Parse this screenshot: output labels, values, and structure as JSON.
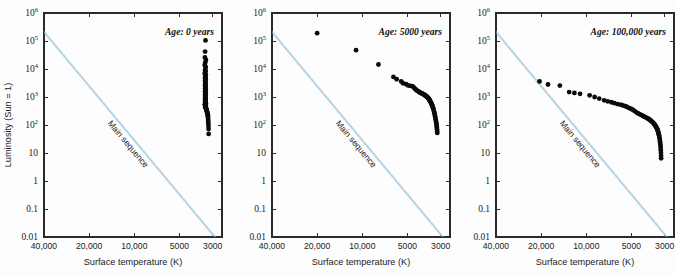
{
  "figure": {
    "panel_count": 3
  },
  "axes": {
    "xlabel": "Surface temperature (K)",
    "ylabel": "Luminosity (Sun = 1)",
    "x_ticks": [
      "40,000",
      "20,000",
      "10,000",
      "5000",
      "3000"
    ],
    "x_tick_values": [
      40000,
      20000,
      10000,
      5000,
      3000
    ],
    "xlim": [
      40000,
      2600
    ],
    "x_scale": "log-reversed",
    "y_ticks": [
      "10^6",
      "10^5",
      "10^4",
      "10^3",
      "10^2",
      "10",
      "1",
      "0.1",
      "0.01"
    ],
    "y_tick_mantissa": [
      "10",
      "10",
      "10",
      "10",
      "10",
      "10",
      "1",
      "0.1",
      "0.01"
    ],
    "y_tick_exponent": [
      "6",
      "5",
      "4",
      "3",
      "2",
      "",
      "",
      "",
      ""
    ],
    "y_tick_values": [
      1000000,
      100000,
      10000,
      1000,
      100,
      10,
      1,
      0.1,
      0.01
    ],
    "ylim": [
      0.01,
      1000000
    ],
    "y_scale": "log",
    "grid": false
  },
  "colors": {
    "main_sequence_line": "#b6d4e4",
    "data_point": "#0a0a0a",
    "axis": "#2b2b2b",
    "background": "#ffffff"
  },
  "main_sequence": {
    "label": "Main sequence",
    "start": {
      "temperature": 40000,
      "luminosity": 210000
    },
    "end": {
      "temperature": 2900,
      "luminosity": 0.01
    }
  },
  "chart_data": [
    {
      "type": "scatter",
      "title": "Age: 0 years",
      "xlabel": "Surface temperature (K)",
      "ylabel": "Luminosity (Sun = 1)",
      "xlim": [
        40000,
        2600
      ],
      "ylim": [
        0.01,
        1000000
      ],
      "grid": false,
      "series": [
        {
          "name": "Main sequence",
          "type": "line",
          "color": "#b6d4e4",
          "x": [
            40000,
            2900
          ],
          "y": [
            210000,
            0.01
          ]
        },
        {
          "name": "Protostars",
          "type": "scatter",
          "color": "#0a0a0a",
          "x": [
            3350,
            3370,
            3380,
            3330,
            3360,
            3390,
            3340,
            3355,
            3365,
            3345,
            3375,
            3385,
            3335,
            3350,
            3360,
            3370,
            3342,
            3358,
            3368,
            3348,
            3362,
            3352,
            3372,
            3346,
            3356,
            3366,
            3344,
            3354,
            3364,
            3374,
            3341,
            3351,
            3361,
            3371,
            3343,
            3353,
            3363,
            3373,
            3347,
            3357,
            3367,
            3349,
            3359,
            3369,
            3339,
            3331,
            3376,
            3386,
            3333,
            3343,
            3353,
            3363,
            3321,
            3311,
            3301,
            3291,
            3281,
            3271,
            3261,
            3251,
            3241,
            3231,
            3226,
            3221,
            3216,
            3211,
            3206,
            3201,
            3196,
            3191
          ],
          "y": [
            105000,
            42000,
            26000,
            21000,
            17000,
            14000,
            12000,
            10500,
            9000,
            8200,
            7400,
            6800,
            6200,
            5600,
            5100,
            4700,
            4300,
            3950,
            3600,
            3300,
            3050,
            2800,
            2600,
            2400,
            2200,
            2050,
            1900,
            1780,
            1650,
            1540,
            1440,
            1350,
            1270,
            1190,
            1120,
            1050,
            990,
            930,
            880,
            830,
            780,
            740,
            700,
            660,
            620,
            590,
            555,
            525,
            495,
            470,
            445,
            420,
            395,
            372,
            350,
            330,
            310,
            292,
            275,
            258,
            240,
            222,
            200,
            178,
            155,
            132,
            110,
            92,
            72,
            48
          ]
        }
      ]
    },
    {
      "type": "scatter",
      "title": "Age: 5000 years",
      "xlabel": "Surface temperature (K)",
      "ylabel": "Luminosity (Sun = 1)",
      "xlim": [
        40000,
        2600
      ],
      "ylim": [
        0.01,
        1000000
      ],
      "grid": false,
      "series": [
        {
          "name": "Main sequence",
          "type": "line",
          "color": "#b6d4e4",
          "x": [
            40000,
            2900
          ],
          "y": [
            210000,
            0.01
          ]
        },
        {
          "name": "Pre-main-sequence stars",
          "type": "scatter",
          "color": "#0a0a0a",
          "x": [
            20000,
            11000,
            7800,
            6200,
            5900,
            5500,
            5350,
            5100,
            4950,
            4800,
            4700,
            4600,
            4500,
            4420,
            4350,
            4280,
            4200,
            4150,
            4100,
            4050,
            4000,
            3960,
            3920,
            3880,
            3840,
            3800,
            3770,
            3740,
            3710,
            3680,
            3650,
            3620,
            3600,
            3580,
            3560,
            3540,
            3520,
            3500,
            3480,
            3460,
            3440,
            3420,
            3400,
            3380,
            3360,
            3340,
            3320,
            3300,
            3285,
            3270,
            3255,
            3240,
            3225,
            3210,
            3200,
            3190,
            3180,
            3175,
            3168,
            3162
          ],
          "y": [
            190000,
            47000,
            14500,
            5200,
            4300,
            3600,
            3100,
            2850,
            2600,
            2500,
            2450,
            2400,
            2100,
            1900,
            1750,
            1650,
            1550,
            1480,
            1420,
            1380,
            1340,
            1300,
            1260,
            1220,
            1180,
            1140,
            1100,
            1060,
            1020,
            980,
            940,
            900,
            860,
            820,
            780,
            740,
            700,
            660,
            620,
            580,
            540,
            500,
            460,
            420,
            380,
            340,
            300,
            265,
            235,
            205,
            180,
            158,
            138,
            120,
            105,
            92,
            80,
            70,
            60,
            52
          ]
        }
      ]
    },
    {
      "type": "scatter",
      "title": "Age: 100,000 years",
      "xlabel": "Surface temperature (K)",
      "ylabel": "Luminosity (Sun = 1)",
      "xlim": [
        40000,
        2600
      ],
      "ylim": [
        0.01,
        1000000
      ],
      "grid": false,
      "series": [
        {
          "name": "Main sequence",
          "type": "line",
          "color": "#b6d4e4",
          "x": [
            40000,
            2900
          ],
          "y": [
            210000,
            0.01
          ]
        },
        {
          "name": "Pre-main-sequence stars",
          "type": "scatter",
          "color": "#0a0a0a",
          "x": [
            20500,
            18000,
            15000,
            13000,
            12000,
            11000,
            9500,
            8800,
            8200,
            7600,
            7200,
            6800,
            6500,
            6200,
            5900,
            5700,
            5500,
            5350,
            5200,
            5050,
            4900,
            4780,
            4660,
            4550,
            4450,
            4350,
            4260,
            4180,
            4100,
            4030,
            3960,
            3900,
            3840,
            3790,
            3740,
            3690,
            3650,
            3610,
            3570,
            3530,
            3500,
            3470,
            3440,
            3410,
            3380,
            3360,
            3340,
            3320,
            3300,
            3285,
            3270,
            3255,
            3240,
            3228,
            3216,
            3205,
            3195,
            3188,
            3182,
            3176,
            3172,
            3168
          ],
          "y": [
            3600,
            2800,
            2550,
            1500,
            1400,
            1300,
            1150,
            1000,
            880,
            760,
            700,
            650,
            600,
            560,
            530,
            500,
            470,
            440,
            410,
            380,
            350,
            320,
            290,
            265,
            250,
            235,
            222,
            210,
            200,
            190,
            180,
            172,
            164,
            156,
            148,
            140,
            132,
            125,
            118,
            110,
            103,
            96,
            90,
            83,
            76,
            70,
            64,
            58,
            52,
            47,
            42,
            37,
            32,
            28,
            24,
            20,
            17,
            14,
            12,
            10,
            8,
            6.5
          ]
        }
      ]
    }
  ]
}
